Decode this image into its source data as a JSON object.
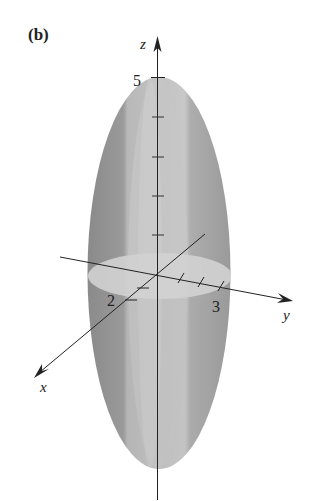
{
  "figure": {
    "panel_label": "(b)",
    "axes": {
      "x": {
        "label": "x",
        "tick_label": "2"
      },
      "y": {
        "label": "y",
        "tick_label": "3"
      },
      "z": {
        "label": "z",
        "tick_label": "5"
      }
    },
    "surface": {
      "type": "ellipsoid",
      "semi_axis_x": 2,
      "semi_axis_y": 3,
      "semi_axis_z": 5
    },
    "colors": {
      "surface_dark": "#8f8f8f",
      "surface_mid": "#a9a9a9",
      "surface_light": "#c4c4c4",
      "cross_section": "#d0d0d0",
      "axis": "#222222"
    }
  }
}
